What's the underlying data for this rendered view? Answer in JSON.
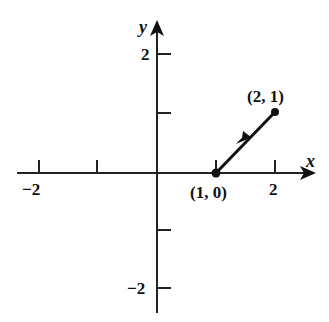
{
  "diagram": {
    "type": "vector-on-coordinate-plane",
    "axes": {
      "x_label": "x",
      "y_label": "y",
      "x_ticks": [
        -2,
        -1,
        1,
        2
      ],
      "y_ticks": [
        -2,
        -1,
        1,
        2
      ],
      "x_tick_labels": {
        "neg2": "−2",
        "pos2": "2"
      },
      "y_tick_labels": {
        "pos2": "2",
        "neg2": "−2"
      }
    },
    "vector": {
      "start": {
        "x": 1,
        "y": 0,
        "label": "(1, 0)"
      },
      "end": {
        "x": 2,
        "y": 1,
        "label": "(2, 1)"
      }
    },
    "colors": {
      "ink": "#111111",
      "background": "#ffffff"
    }
  }
}
